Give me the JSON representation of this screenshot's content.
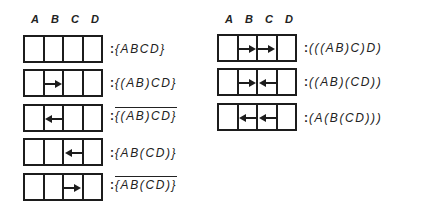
{
  "headers": {
    "left": [
      "A",
      "B",
      "C",
      "D"
    ],
    "right": [
      "A",
      "B",
      "C",
      "D"
    ]
  },
  "colon": ":",
  "rows_left": [
    {
      "label": "{ABCD}",
      "negated": false,
      "arrows": [
        "",
        "",
        "",
        ""
      ]
    },
    {
      "label": "{(AB)CD}",
      "negated": false,
      "arrows": [
        "",
        "right",
        "",
        ""
      ]
    },
    {
      "label": "{(AB)CD}",
      "negated": true,
      "arrows": [
        "",
        "left",
        "",
        ""
      ]
    },
    {
      "label": "{AB(CD)}",
      "negated": false,
      "arrows": [
        "",
        "",
        "left",
        ""
      ]
    },
    {
      "label": "{AB(CD)}",
      "negated": true,
      "arrows": [
        "",
        "",
        "right",
        ""
      ]
    }
  ],
  "rows_right": [
    {
      "label": "(((AB)C)D)",
      "negated": false,
      "arrows": [
        "",
        "right",
        "right",
        ""
      ]
    },
    {
      "label": "((AB)(CD))",
      "negated": false,
      "arrows": [
        "",
        "right",
        "left",
        ""
      ]
    },
    {
      "label": "(A(B(CD)))",
      "negated": false,
      "arrows": [
        "",
        "left",
        "left",
        ""
      ]
    }
  ],
  "colors": {
    "ink": "#1c1c1c",
    "background": "#ffffff"
  }
}
